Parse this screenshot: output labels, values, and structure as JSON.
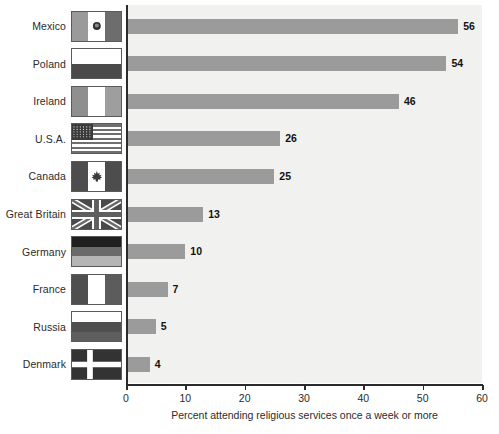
{
  "chart_data": {
    "type": "bar",
    "orientation": "horizontal",
    "title": "",
    "xlabel": "Percent attending religious services once a week or more",
    "ylabel": "",
    "xlim": [
      0,
      60
    ],
    "xticks": [
      0,
      10,
      20,
      30,
      40,
      50,
      60
    ],
    "grid": false,
    "legend": "none",
    "categories": [
      "Mexico",
      "Poland",
      "Ireland",
      "U.S.A.",
      "Canada",
      "Great Britain",
      "Germany",
      "France",
      "Russia",
      "Denmark"
    ],
    "values": [
      56,
      54,
      46,
      26,
      25,
      13,
      10,
      7,
      5,
      4
    ],
    "value_labels": [
      "56",
      "54",
      "46",
      "26",
      "25",
      "13",
      "10",
      "7",
      "5",
      "4"
    ],
    "bar_color": "#9b9b9b",
    "plot_background": "#f1f1ef",
    "axis_color": "#2b2b2b"
  },
  "axis": {
    "tick_labels": [
      "0",
      "10",
      "20",
      "30",
      "40",
      "50",
      "60"
    ],
    "title": "Percent attending religious services once a week or more"
  },
  "rows": [
    {
      "country": "Mexico",
      "value_label": "56",
      "flag_icon": "flag-mexico-icon"
    },
    {
      "country": "Poland",
      "value_label": "54",
      "flag_icon": "flag-poland-icon"
    },
    {
      "country": "Ireland",
      "value_label": "46",
      "flag_icon": "flag-ireland-icon"
    },
    {
      "country": "U.S.A.",
      "value_label": "26",
      "flag_icon": "flag-usa-icon"
    },
    {
      "country": "Canada",
      "value_label": "25",
      "flag_icon": "flag-canada-icon"
    },
    {
      "country": "Great Britain",
      "value_label": "13",
      "flag_icon": "flag-great-britain-icon"
    },
    {
      "country": "Germany",
      "value_label": "10",
      "flag_icon": "flag-germany-icon"
    },
    {
      "country": "France",
      "value_label": "7",
      "flag_icon": "flag-france-icon"
    },
    {
      "country": "Russia",
      "value_label": "5",
      "flag_icon": "flag-russia-icon"
    },
    {
      "country": "Denmark",
      "value_label": "4",
      "flag_icon": "flag-denmark-icon"
    }
  ]
}
